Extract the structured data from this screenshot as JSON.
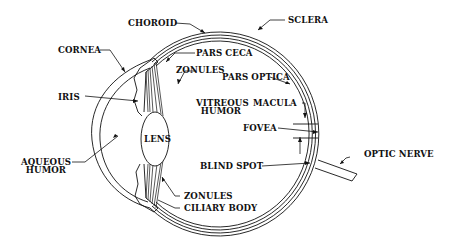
{
  "diagram": {
    "labels": {
      "choroid": "CHOROID",
      "sclera": "SCLERA",
      "cornea": "CORNEA",
      "pars_ceca": "PARS CECA",
      "zonules_top": "ZONULES",
      "pars_optica": "PARS OPTICA",
      "iris": "IRIS",
      "vitreous_1": "VITREOUS",
      "vitreous_2": "HUMOR",
      "macula": "MACULA",
      "fovea": "FOVEA",
      "lens": "LENS",
      "aqueous_1": "AQUEOUS",
      "aqueous_2": "HUMOR",
      "blind_spot": "BLIND SPOT",
      "optic_nerve": "OPTIC NERVE",
      "zonules_bottom": "ZONULES",
      "ciliary_body": "CILIARY BODY"
    },
    "colors": {
      "ink": "#111111",
      "background": "#ffffff"
    }
  }
}
